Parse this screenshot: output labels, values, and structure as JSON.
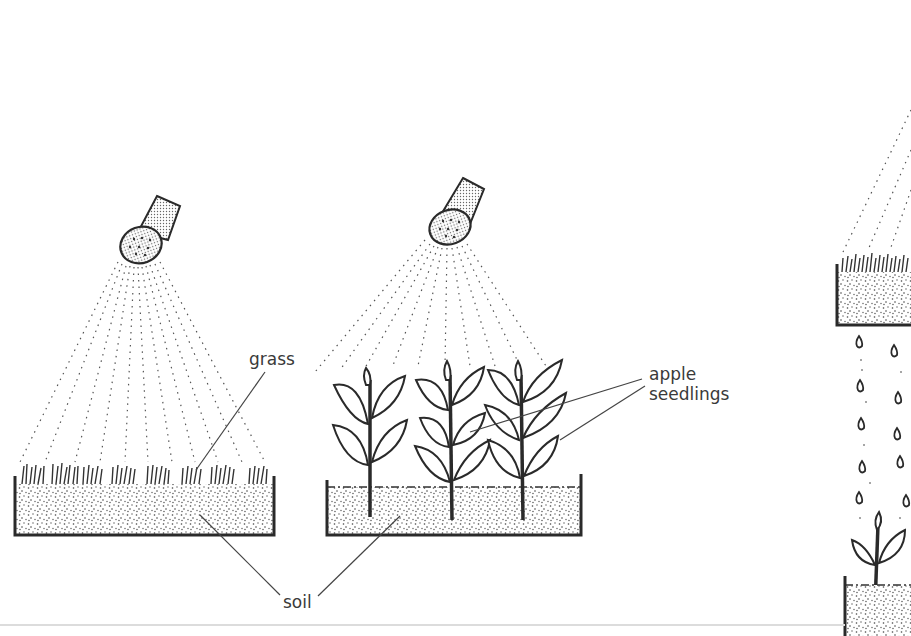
{
  "diagram": {
    "panels": [
      {
        "id": "grass-tray",
        "description": "watering can rose spraying over a tray of grass on soil"
      },
      {
        "id": "seedling-tray",
        "description": "watering can rose spraying over a tray of three apple seedlings on soil"
      },
      {
        "id": "partial-right-panel",
        "description": "partially visible: grass tray dripping water drops onto a seedling in soil below"
      }
    ],
    "labels": {
      "grass": "grass",
      "apple_seedlings_line1": "apple",
      "apple_seedlings_line2": "seedlings",
      "soil": "soil"
    },
    "colors": {
      "ink": "#2a2a2a",
      "label_text": "#3a3a3a",
      "background": "#ffffff"
    }
  }
}
